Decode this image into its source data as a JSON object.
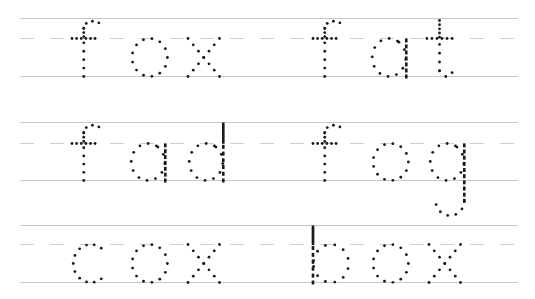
{
  "worksheet": {
    "title": "Tracing practice: words with f, o, x",
    "colors": {
      "dots": "#1a1a1a",
      "guide_solid": "#c8c8c8",
      "guide_dash": "#cfcfcf",
      "paper": "#ffffff"
    },
    "rows": [
      {
        "words": [
          "fox",
          "fat"
        ]
      },
      {
        "words": [
          "fad",
          "fog"
        ]
      },
      {
        "words": [
          "cox",
          "box"
        ]
      }
    ]
  }
}
